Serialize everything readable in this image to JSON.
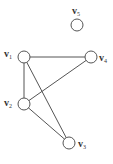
{
  "graph": {
    "nodes": [
      {
        "id": "v1",
        "label": "v",
        "sub": "1",
        "x": 24,
        "y": 57
      },
      {
        "id": "v2",
        "label": "v",
        "sub": "2",
        "x": 24,
        "y": 104
      },
      {
        "id": "v3",
        "label": "v",
        "sub": "3",
        "x": 69,
        "y": 143
      },
      {
        "id": "v4",
        "label": "v",
        "sub": "4",
        "x": 91,
        "y": 57
      },
      {
        "id": "v5",
        "label": "v",
        "sub": "5",
        "x": 77,
        "y": 25
      }
    ],
    "edges": [
      {
        "from": "v1",
        "to": "v4"
      },
      {
        "from": "v1",
        "to": "v2"
      },
      {
        "from": "v1",
        "to": "v3"
      },
      {
        "from": "v2",
        "to": "v4"
      },
      {
        "from": "v2",
        "to": "v3"
      }
    ],
    "node_radius": 6,
    "stroke_color": "#555555"
  }
}
